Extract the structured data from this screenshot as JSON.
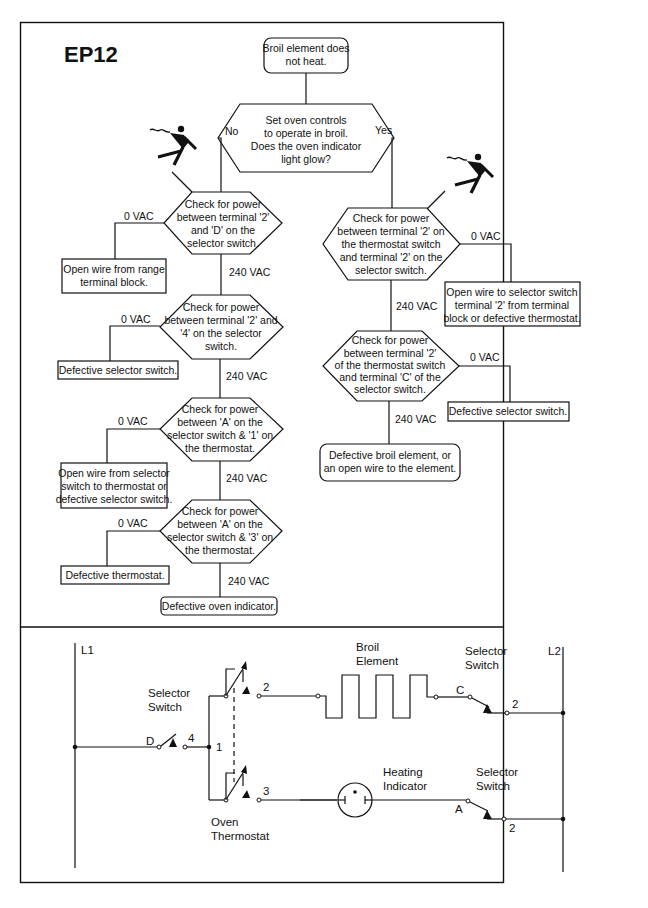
{
  "title": "EP12",
  "flowchart": {
    "start": [
      "Broil element does",
      "not heat."
    ],
    "decision": [
      "Set oven controls",
      "to operate in broil.",
      "Does the oven indicator",
      "light glow?"
    ],
    "no_label": "No",
    "yes_label": "Yes",
    "left_checks": [
      {
        "text": [
          "Check for power",
          "between terminal '2'",
          "and 'D' on the",
          "selector switch."
        ],
        "fail_label": "0 VAC",
        "fail_result": [
          "Open wire from range",
          "terminal block."
        ],
        "pass_label": "240 VAC"
      },
      {
        "text": [
          "Check for power",
          "between terminal '2' and",
          "'4' on the selector",
          "switch."
        ],
        "fail_label": "0 VAC",
        "fail_result": [
          "Defective selector switch."
        ],
        "pass_label": "240 VAC"
      },
      {
        "text": [
          "Check for power",
          "between 'A' on the",
          "selector switch & '1' on",
          "the thermostat."
        ],
        "fail_label": "0 VAC",
        "fail_result": [
          "Open wire from selector",
          "switch to thermostat or",
          "defective selector switch."
        ],
        "pass_label": "240 VAC"
      },
      {
        "text": [
          "Check for power",
          "between 'A' on the",
          "selector switch & '3' on",
          "the thermostat."
        ],
        "fail_label": "0 VAC",
        "fail_result": [
          "Defective thermostat."
        ],
        "pass_label": "240 VAC"
      }
    ],
    "left_end": "Defective oven indicator.",
    "right_checks": [
      {
        "text": [
          "Check for power",
          "between terminal '2' on",
          "the thermostat switch",
          "and terminal '2' on the",
          "selector switch."
        ],
        "fail_label": "0 VAC",
        "fail_result": [
          "Open wire to selector switch",
          "terminal '2' from terminal",
          "block or defective thermostat."
        ],
        "pass_label": "240 VAC"
      },
      {
        "text": [
          "Check for power",
          "between terminal '2'",
          "of the thermostat switch",
          "and terminal 'C' of the",
          "selector switch."
        ],
        "fail_label": "0 VAC",
        "fail_result": [
          "Defective selector switch."
        ],
        "pass_label": "240 VAC"
      }
    ],
    "right_end": [
      "Defective broil element, or",
      "an open wire to the element."
    ],
    "hazard_icons": [
      "electrical-shock-hazard-icon",
      "electrical-shock-hazard-icon"
    ]
  },
  "schematic": {
    "l1": "L1",
    "l2": "L2",
    "selector_switch_label": [
      "Selector",
      "Switch"
    ],
    "oven_thermostat_label": [
      "Oven",
      "Thermostat"
    ],
    "broil_element_label": [
      "Broil",
      "Element"
    ],
    "heating_indicator_label": [
      "Heating",
      "Indicator"
    ],
    "terminals": {
      "D": "D",
      "4": "4",
      "1": "1",
      "2": "2",
      "3": "3",
      "C": "C",
      "A": "A"
    }
  }
}
